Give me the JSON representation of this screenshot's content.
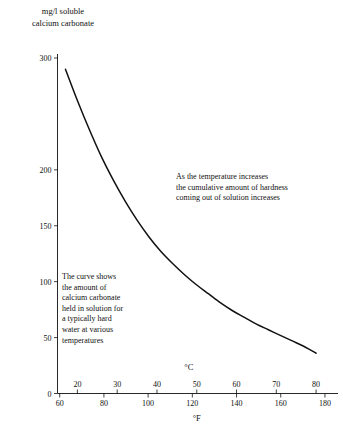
{
  "chart_data": {
    "type": "line",
    "title": "",
    "ylabel": "mg/l soluble\ncalcium carbonate",
    "xlabel_primary": "°C",
    "xlabel_secondary": "°F",
    "ylim": [
      0,
      300
    ],
    "xlim_celsius": [
      15,
      85
    ],
    "xlim_fahrenheit": [
      59,
      185
    ],
    "yticks": [
      0,
      50,
      100,
      150,
      200,
      300
    ],
    "ytick_labels": [
      "0",
      "50",
      "100",
      "150",
      "200",
      "300"
    ],
    "xticks_celsius": [
      20,
      30,
      40,
      50,
      60,
      70,
      80
    ],
    "xtick_labels_celsius": [
      "20",
      "30",
      "40",
      "50",
      "60",
      "70",
      "80"
    ],
    "xticks_fahrenheit": [
      60,
      80,
      100,
      120,
      140,
      160,
      180
    ],
    "xtick_labels_fahrenheit": [
      "60",
      "80",
      "100",
      "120",
      "140",
      "160",
      "180"
    ],
    "grid": false,
    "legend": false,
    "series": [
      {
        "name": "calcium carbonate solubility",
        "color": "#111111",
        "x_celsius": [
          17,
          20,
          23,
          26,
          29,
          32,
          35,
          38,
          41,
          44,
          47,
          50,
          53,
          56,
          59,
          62,
          65,
          68,
          71,
          74,
          77,
          80
        ],
        "y": [
          290,
          262,
          236,
          212,
          191,
          172,
          155,
          140,
          127,
          116,
          106,
          97,
          89,
          81,
          74,
          68,
          62,
          57,
          52,
          47,
          42,
          36
        ]
      }
    ],
    "annotations": [
      {
        "name": "curve-description",
        "text": "The curve shows\nthe amount of\ncalcium carbonate\nheld in solution for\na typically hard\nwater at various\ntemperatures"
      },
      {
        "name": "temperature-trend",
        "text": "As the temperature increases\nthe cumulative amount of hardness\ncoming out of solution increases"
      }
    ]
  },
  "axis": {
    "y_title": "mg/l soluble\ncalcium carbonate",
    "celsius_unit": "°C",
    "fahrenheit_unit": "°F"
  },
  "colors": {
    "background": "#ffffff",
    "ink": "#111111",
    "curve": "#111111"
  }
}
